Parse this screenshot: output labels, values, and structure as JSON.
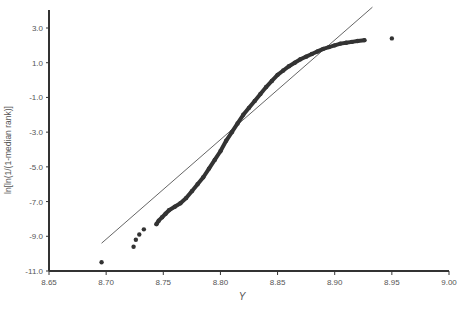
{
  "chart_data": {
    "type": "scatter",
    "title": "",
    "xlabel": "Y",
    "ylabel": "ln[ln(1/(1-median rank)]",
    "xlim": [
      8.65,
      9.0
    ],
    "ylim": [
      -11.0,
      3.0
    ],
    "x_ticks": [
      "8.65",
      "8.70",
      "8.75",
      "8.80",
      "8.85",
      "8.90",
      "8.95",
      "9.00"
    ],
    "y_ticks": [
      "3.0",
      "1.0",
      "-1.0",
      "-3.0",
      "-5.0",
      "-7.0",
      "-9.0",
      "-11.0"
    ],
    "grid": false,
    "legend": null,
    "series": [
      {
        "name": "data points",
        "kind": "scatter",
        "color": "#333333",
        "points": [
          [
            8.696,
            -10.5
          ],
          [
            8.724,
            -9.6
          ],
          [
            8.726,
            -9.2
          ],
          [
            8.729,
            -8.9
          ],
          [
            8.733,
            -8.6
          ],
          [
            8.744,
            -8.3
          ],
          [
            8.746,
            -8.1
          ],
          [
            8.749,
            -7.9
          ],
          [
            8.752,
            -7.7
          ],
          [
            8.755,
            -7.5
          ],
          [
            8.76,
            -7.3
          ],
          [
            8.765,
            -7.1
          ],
          [
            8.77,
            -6.8
          ],
          [
            8.775,
            -6.4
          ],
          [
            8.78,
            -6.0
          ],
          [
            8.785,
            -5.6
          ],
          [
            8.79,
            -5.1
          ],
          [
            8.795,
            -4.6
          ],
          [
            8.8,
            -4.1
          ],
          [
            8.805,
            -3.5
          ],
          [
            8.81,
            -3.0
          ],
          [
            8.815,
            -2.5
          ],
          [
            8.82,
            -2.0
          ],
          [
            8.825,
            -1.6
          ],
          [
            8.83,
            -1.2
          ],
          [
            8.835,
            -0.8
          ],
          [
            8.84,
            -0.4
          ],
          [
            8.845,
            -0.05
          ],
          [
            8.85,
            0.3
          ],
          [
            8.855,
            0.55
          ],
          [
            8.86,
            0.8
          ],
          [
            8.865,
            1.0
          ],
          [
            8.87,
            1.2
          ],
          [
            8.875,
            1.35
          ],
          [
            8.88,
            1.5
          ],
          [
            8.885,
            1.65
          ],
          [
            8.89,
            1.8
          ],
          [
            8.895,
            1.9
          ],
          [
            8.9,
            2.0
          ],
          [
            8.905,
            2.1
          ],
          [
            8.91,
            2.15
          ],
          [
            8.915,
            2.2
          ],
          [
            8.92,
            2.25
          ],
          [
            8.926,
            2.3
          ],
          [
            8.95,
            2.4
          ]
        ]
      },
      {
        "name": "fitted line",
        "kind": "line",
        "color": "#666666",
        "points": [
          [
            8.696,
            -9.4
          ],
          [
            8.933,
            4.2
          ]
        ]
      }
    ]
  }
}
